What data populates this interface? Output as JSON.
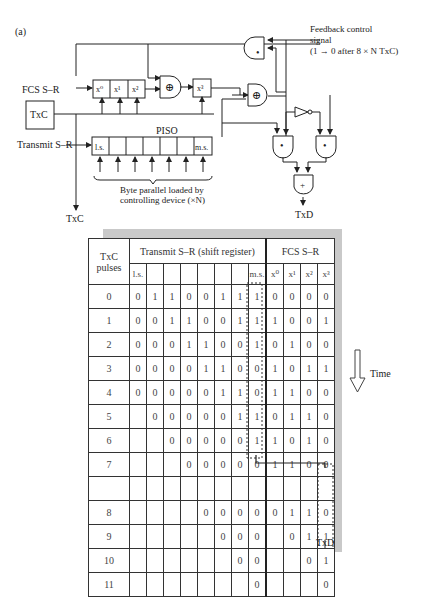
{
  "figure_label": "(a)",
  "diagram": {
    "fcs_label": "FCS S–R",
    "fcs_cells": [
      "x⁰",
      "x¹",
      "x²"
    ],
    "x3_cell": "x³",
    "txc_box": "TxC",
    "transmit_label": "Transmit S–R",
    "piso_label": "PISO",
    "piso_ls": "l.s.",
    "piso_ms": "m.s.",
    "brace_label_1": "Byte parallel loaded by",
    "brace_label_2": "controlling device (×N)",
    "txc_output": "TxC",
    "feedback_1": "Feedback control",
    "feedback_2": "signal",
    "feedback_3": "(1 → 0 after 8 × N TxC)",
    "xor_symbol": "⊕",
    "and_symbol": "•",
    "or_symbol": "+",
    "txd_output": "TxD"
  },
  "table": {
    "col_pulses_1": "TxC",
    "col_pulses_2": "pulses",
    "col_transmit": "Transmit S–R (shift register)",
    "col_fcs": "FCS S–R",
    "transmit_sub": [
      "l.s.",
      "",
      "",
      "",
      "",
      "",
      "",
      "m.s."
    ],
    "fcs_sub": [
      "x⁰",
      "x¹",
      "x²",
      "x³"
    ],
    "rows": [
      {
        "pulse": "0",
        "tx": [
          "0",
          "1",
          "1",
          "0",
          "0",
          "1",
          "1",
          "1"
        ],
        "fcs": [
          "0",
          "0",
          "0",
          "0"
        ]
      },
      {
        "pulse": "1",
        "tx": [
          "0",
          "0",
          "1",
          "1",
          "0",
          "0",
          "1",
          "1"
        ],
        "fcs": [
          "1",
          "0",
          "0",
          "1"
        ]
      },
      {
        "pulse": "2",
        "tx": [
          "0",
          "0",
          "0",
          "1",
          "1",
          "0",
          "0",
          "1"
        ],
        "fcs": [
          "0",
          "1",
          "0",
          "0"
        ]
      },
      {
        "pulse": "3",
        "tx": [
          "0",
          "0",
          "0",
          "0",
          "1",
          "1",
          "0",
          "0"
        ],
        "fcs": [
          "1",
          "0",
          "1",
          "1"
        ]
      },
      {
        "pulse": "4",
        "tx": [
          "0",
          "0",
          "0",
          "0",
          "0",
          "1",
          "1",
          "0"
        ],
        "fcs": [
          "1",
          "1",
          "0",
          "0"
        ]
      },
      {
        "pulse": "5",
        "tx": [
          "",
          "0",
          "0",
          "0",
          "0",
          "0",
          "1",
          "1"
        ],
        "fcs": [
          "0",
          "1",
          "1",
          "0"
        ]
      },
      {
        "pulse": "6",
        "tx": [
          "",
          "",
          "0",
          "0",
          "0",
          "0",
          "0",
          "1"
        ],
        "fcs": [
          "1",
          "0",
          "1",
          "0"
        ]
      },
      {
        "pulse": "7",
        "tx": [
          "",
          "",
          "",
          "0",
          "0",
          "0",
          "0",
          "0"
        ],
        "fcs": [
          "1",
          "1",
          "0",
          "0"
        ]
      },
      {
        "pulse": "",
        "tx": [
          "",
          "",
          "",
          "",
          "",
          "",
          "",
          ""
        ],
        "fcs": [
          "",
          "",
          "",
          ""
        ]
      },
      {
        "pulse": "8",
        "tx": [
          "",
          "",
          "",
          "",
          "0",
          "0",
          "0",
          "0"
        ],
        "fcs": [
          "0",
          "1",
          "1",
          "0"
        ]
      },
      {
        "pulse": "9",
        "tx": [
          "",
          "",
          "",
          "",
          "",
          "0",
          "0",
          "0"
        ],
        "fcs": [
          "",
          "0",
          "1",
          "1"
        ]
      },
      {
        "pulse": "10",
        "tx": [
          "",
          "",
          "",
          "",
          "",
          "",
          "0",
          "0"
        ],
        "fcs": [
          "",
          "",
          "0",
          "1"
        ]
      },
      {
        "pulse": "11",
        "tx": [
          "",
          "",
          "",
          "",
          "",
          "",
          "",
          "0"
        ],
        "fcs": [
          "",
          "",
          "",
          "0"
        ]
      }
    ],
    "time_label": "Time",
    "txd_label": "TxD"
  }
}
